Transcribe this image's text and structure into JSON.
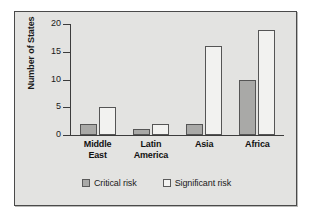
{
  "chart_data": {
    "type": "bar",
    "title": "",
    "subtitle": "",
    "xlabel": "",
    "ylabel": "Number of States",
    "ylim": [
      0,
      20
    ],
    "yticks": [
      0,
      5,
      10,
      15,
      20
    ],
    "grid": false,
    "legend_position": "bottom-center",
    "categories": [
      "Middle East",
      "Latin America",
      "Asia",
      "Africa"
    ],
    "category_lines": [
      [
        "Middle",
        "East"
      ],
      [
        "Latin",
        "America"
      ],
      [
        "Asia"
      ],
      [
        "Africa"
      ]
    ],
    "series": [
      {
        "name": "Critical risk",
        "color": "#a9a9a7",
        "values": [
          2,
          1,
          2,
          10
        ]
      },
      {
        "name": "Significant risk",
        "color": "#f2f2f0",
        "values": [
          5,
          2,
          16,
          19
        ]
      }
    ]
  },
  "axis": {
    "y_title": "Number of States",
    "y_tick_labels": [
      "20",
      "15",
      "10",
      "5",
      "0"
    ]
  },
  "legend": {
    "entries": [
      {
        "label": "Critical risk",
        "swatch": "critical"
      },
      {
        "label": "Significant risk",
        "swatch": "significant"
      }
    ]
  },
  "colors": {
    "panel_background": "#e3e3e1",
    "panel_border": "#4a4a4a",
    "axis_line": "#3c3c3c",
    "critical_risk": "#a9a9a7",
    "significant_risk": "#f2f2f0",
    "bar_outline": "#555555",
    "text": "#1a1a1a"
  }
}
